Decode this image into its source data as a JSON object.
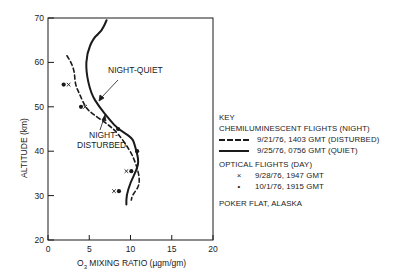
{
  "chart_data": {
    "type": "line",
    "title": "",
    "xlabel": "O3 MIXING RATIO (µgm/gm)",
    "ylabel": "ALTITUDE (km)",
    "xlim": [
      0,
      20
    ],
    "ylim": [
      20,
      70
    ],
    "x_ticks": [
      0,
      5,
      10,
      15,
      20
    ],
    "y_ticks": [
      20,
      30,
      40,
      50,
      60,
      70
    ],
    "grid": false,
    "legend_position": "right",
    "series": [
      {
        "name": "9/21/76, 1403 GMT (DISTURBED)",
        "group": "CHEMILUMINESCENT FLIGHTS (NIGHT)",
        "style": "dashed",
        "points": [
          [
            2.3,
            61.5
          ],
          [
            2.8,
            60
          ],
          [
            3.2,
            58
          ],
          [
            3.3,
            55
          ],
          [
            3.8,
            53
          ],
          [
            4.5,
            50
          ],
          [
            5.3,
            48.5
          ],
          [
            7.3,
            46
          ],
          [
            8.5,
            44
          ],
          [
            10.0,
            40
          ],
          [
            10.7,
            37
          ],
          [
            11.1,
            34
          ],
          [
            11.0,
            32
          ],
          [
            10.2,
            30
          ],
          [
            10.1,
            29
          ]
        ]
      },
      {
        "name": "9/25/76, 0756 GMT (QUIET)",
        "group": "CHEMILUMINESCENT FLIGHTS (NIGHT)",
        "style": "solid",
        "points": [
          [
            7.1,
            69.5
          ],
          [
            6.5,
            67
          ],
          [
            5.5,
            65.5
          ],
          [
            4.7,
            62
          ],
          [
            4.6,
            58
          ],
          [
            5.2,
            53
          ],
          [
            6.2,
            50
          ],
          [
            7.5,
            47
          ],
          [
            8.5,
            45
          ],
          [
            10.2,
            43
          ],
          [
            10.5,
            41.5
          ],
          [
            11.0,
            38
          ],
          [
            10.8,
            36
          ],
          [
            10.0,
            33
          ],
          [
            9.5,
            30
          ],
          [
            9.5,
            28
          ]
        ]
      },
      {
        "name": "9/28/76, 1947 GMT",
        "group": "OPTICAL FLIGHTS (DAY)",
        "style": "marker-x",
        "points": [
          [
            2.5,
            55
          ],
          [
            4.5,
            50
          ],
          [
            9.5,
            35.5
          ],
          [
            8.0,
            31
          ]
        ]
      },
      {
        "name": "10/1/76, 1915 GMT",
        "group": "OPTICAL FLIGHTS (DAY)",
        "style": "marker-dot",
        "points": [
          [
            1.9,
            55
          ],
          [
            4.0,
            50
          ],
          [
            8.5,
            45
          ],
          [
            10.8,
            40
          ],
          [
            10.1,
            35.5
          ],
          [
            8.6,
            31
          ]
        ]
      }
    ],
    "annotations": [
      {
        "text": "NIGHT-QUIET",
        "x": 7.5,
        "y": 58.5,
        "arrow_to": [
          6.2,
          50
        ]
      },
      {
        "text": "NIGHT-\nDISTURBED",
        "x": 5.5,
        "y": 40,
        "arrow_to": [
          6.8,
          47
        ]
      }
    ]
  },
  "axes": {
    "x_tick_labels": [
      "0",
      "5",
      "10",
      "15",
      "20"
    ],
    "y_tick_labels": [
      "20",
      "30",
      "40",
      "50",
      "60",
      "70"
    ],
    "xlabel_prefix": "O",
    "xlabel_sub": "3",
    "xlabel_rest": " MIXING RATIO (µgm/gm)",
    "ylabel": "ALTITUDE (km)"
  },
  "annotations": {
    "quiet": "NIGHT-QUIET",
    "disturbed_1": "NIGHT-",
    "disturbed_2": "DISTURBED"
  },
  "legend": {
    "key": "KEY",
    "group1": "CHEMILUMINESCENT FLIGHTS (NIGHT)",
    "item1": "9/21/76, 1403 GMT (DISTURBED)",
    "item2": "9/25/76, 0756 GMT  (QUIET)",
    "group2": "OPTICAL FLIGHTS (DAY)",
    "item3_marker": "×",
    "item3": "9/28/76, 1947 GMT",
    "item4_marker": "•",
    "item4": "10/1/76, 1915 GMT",
    "location": "POKER FLAT, ALASKA"
  }
}
